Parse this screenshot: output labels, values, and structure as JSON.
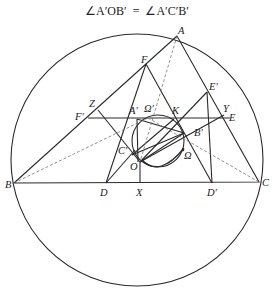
{
  "title": {
    "left": "∠A′OB′",
    "eq": "=",
    "right": "∠A′C′B′"
  },
  "labels": {
    "A": "A",
    "B": "B",
    "C": "C",
    "F": "F",
    "E_prime": "E′",
    "Z": "Z",
    "F_prime": "F′",
    "A_prime": "A′",
    "Omega_prime": "Ω′",
    "K": "K",
    "Y": "Y",
    "E": "E",
    "B_prime": "B′",
    "Omega": "Ω",
    "C_prime": "C′",
    "O": "O",
    "D": "D",
    "X": "X",
    "D_prime": "D′"
  },
  "colors": {
    "stroke": "#2a2a2a",
    "dashed": "#777777"
  }
}
